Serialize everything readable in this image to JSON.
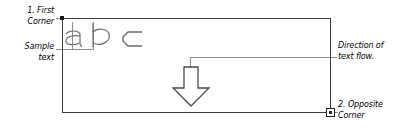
{
  "diagram": {
    "labels": {
      "first_corner": "1. First\nCorner",
      "sample_text": "Sample\ntext",
      "direction": "Direction of\ntext flow.",
      "opposite_corner": "2. Opposite\nCorner"
    },
    "sample_glyphs": [
      "a",
      "b",
      "c"
    ],
    "icons": {
      "corner_start": "corner-point-icon",
      "corner_end": "corner-grip-handle-icon",
      "flow_direction": "down-arrow-icon"
    },
    "colors": {
      "frame": "#3b3b3b",
      "leader": "#8d8d8d",
      "glyph": "#6a6a6a",
      "handle": "#1a1a1a",
      "background": "#ffffff"
    }
  }
}
